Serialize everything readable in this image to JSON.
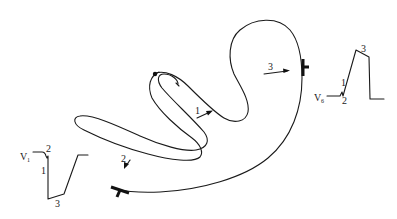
{
  "diagram": {
    "pathway_arrows": [
      {
        "label": "1"
      },
      {
        "label": "2"
      },
      {
        "label": "3"
      }
    ],
    "lead_v1": {
      "lead": "V",
      "subscript": "1",
      "deflection_labels": [
        "1",
        "2",
        "3"
      ]
    },
    "lead_v6": {
      "lead": "V",
      "subscript": "6",
      "deflection_labels": [
        "1",
        "2",
        "3"
      ]
    },
    "colors": {
      "line": "#1a1a1a",
      "background": "#ffffff"
    }
  }
}
